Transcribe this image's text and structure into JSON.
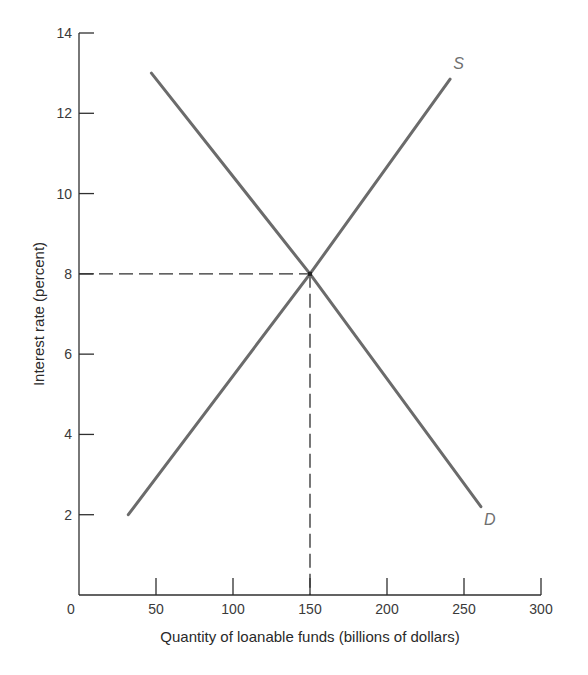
{
  "chart_data": {
    "type": "line",
    "title": "",
    "xlabel": "Quantity of loanable funds (billions of dollars)",
    "ylabel": "Interest rate (percent)",
    "xlim": [
      0,
      300
    ],
    "ylim": [
      0,
      14
    ],
    "x_ticks": [
      0,
      50,
      100,
      150,
      200,
      250,
      300
    ],
    "y_ticks": [
      2,
      4,
      6,
      8,
      10,
      12,
      14
    ],
    "grid": false,
    "legend": "none (curves labeled directly)",
    "series": [
      {
        "name": "S",
        "label": "S",
        "description": "Supply of loanable funds",
        "points": [
          [
            32,
            2.0
          ],
          [
            150,
            8.0
          ],
          [
            241,
            12.85
          ]
        ],
        "color": "#6b6b6b"
      },
      {
        "name": "D",
        "label": "D",
        "description": "Demand for loanable funds",
        "points": [
          [
            47,
            13.0
          ],
          [
            150,
            8.0
          ],
          [
            261,
            2.2
          ]
        ],
        "color": "#6b6b6b"
      }
    ],
    "annotations": [
      {
        "type": "equilibrium",
        "x": 150,
        "y": 8,
        "guides": "dashed lines to both axes"
      }
    ]
  },
  "labels": {
    "x_axis_title": "Quantity of loanable funds (billions of dollars)",
    "y_axis_title": "Interest rate (percent)",
    "supply_label": "S",
    "demand_label": "D",
    "x_tick_labels": [
      "0",
      "50",
      "100",
      "150",
      "200",
      "250",
      "300"
    ],
    "y_tick_labels": [
      "2",
      "4",
      "6",
      "8",
      "10",
      "12",
      "14"
    ]
  },
  "colors": {
    "curve": "#6b6b6b",
    "axis": "#2f2f2f",
    "dashed_guide": "#2f2f2f",
    "background": "#ffffff"
  }
}
